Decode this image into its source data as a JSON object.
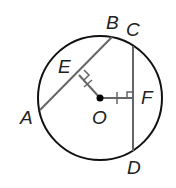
{
  "diagram": {
    "type": "circle-geometry",
    "labels": {
      "A": "A",
      "B": "B",
      "C": "C",
      "D": "D",
      "E": "E",
      "F": "F",
      "O": "O"
    },
    "colors": {
      "circle": "#111111",
      "chord": "#666666",
      "center": "#000000"
    },
    "circle": {
      "cx": 100,
      "cy": 98,
      "r": 62
    },
    "chords": [
      {
        "from": "A",
        "to": "B"
      },
      {
        "from": "C",
        "to": "D"
      }
    ],
    "segments": [
      {
        "from": "O",
        "to": "E",
        "tick_marks": 1,
        "right_angle_at": "E"
      },
      {
        "from": "O",
        "to": "F",
        "tick_marks": 1,
        "right_angle_at": "F"
      }
    ]
  }
}
